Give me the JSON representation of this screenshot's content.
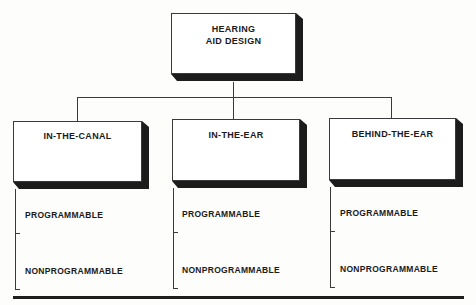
{
  "diagram": {
    "root": {
      "title_line1": "HEARING",
      "title_line2": "AID DESIGN"
    },
    "categories": [
      {
        "label": "IN-THE-CANAL",
        "options": [
          "PROGRAMMABLE",
          "NONPROGRAMMABLE"
        ]
      },
      {
        "label": "IN-THE-EAR",
        "options": [
          "PROGRAMMABLE",
          "NONPROGRAMMABLE"
        ]
      },
      {
        "label": "BEHIND-THE-EAR",
        "options": [
          "PROGRAMMABLE",
          "NONPROGRAMMABLE"
        ]
      }
    ]
  },
  "colors": {
    "line": "#3a3a3a",
    "shadow": "#1c1c1c",
    "background": "#ffffff",
    "text": "#1a1a1a"
  }
}
